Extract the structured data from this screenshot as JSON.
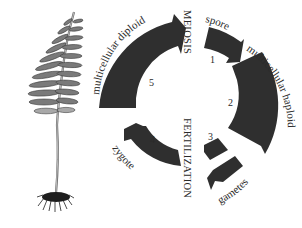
{
  "diagram": {
    "colors": {
      "arrow_fill": "#2f2f2f",
      "text": "#2a2a2a",
      "background": "#ffffff",
      "plant_dark": "#3a3a3a",
      "plant_light": "#9a9a9a"
    },
    "phase_labels": {
      "meiosis": "MEIOSIS",
      "fertilization": "FERTILIZATION"
    },
    "stages": [
      {
        "number": "1",
        "label": "spore"
      },
      {
        "number": "2",
        "label": "multicellular haploid"
      },
      {
        "number": "3",
        "label": "gametes"
      },
      {
        "number": "4",
        "label": "zygote"
      },
      {
        "number": "5",
        "label": "multicellular diploid"
      }
    ],
    "illustration": "fern-sporophyte"
  }
}
